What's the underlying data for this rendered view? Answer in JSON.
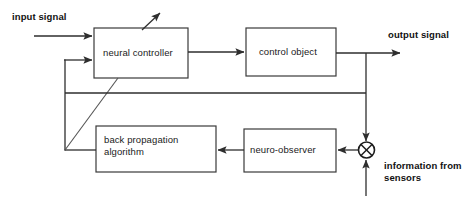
{
  "diagram": {
    "background_color": "#ffffff",
    "line_color": "#2e2e2e",
    "box_stroke_color": "#3a3a3a",
    "text_color": "#1a1a1a",
    "blocks": [
      {
        "id": "neural_controller",
        "label": "neural controller"
      },
      {
        "id": "control_object",
        "label": "control object"
      },
      {
        "id": "back_propagation",
        "label": "back propagation\nalgorithm"
      },
      {
        "id": "neuro_observer",
        "label": "neuro-observer"
      }
    ],
    "labels": {
      "input_signal": "input signal",
      "output_signal": "output signal",
      "information_from_sensors": "information from\nsensors"
    },
    "junction": {
      "name": "summing-junction",
      "symbol": "circle-with-x"
    }
  }
}
